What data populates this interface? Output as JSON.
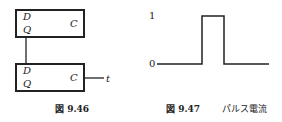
{
  "figure_946": {
    "caption": "図 9.46",
    "top_box": {
      "d": "D",
      "q": "Q",
      "c": "C"
    },
    "bottom_box": {
      "d": "D",
      "q": "Q",
      "c": "C"
    },
    "output_label": "t"
  },
  "figure_947": {
    "caption_num": "図 9.47",
    "caption_text": "パルス電流",
    "y_high": "1",
    "y_low": "0"
  }
}
